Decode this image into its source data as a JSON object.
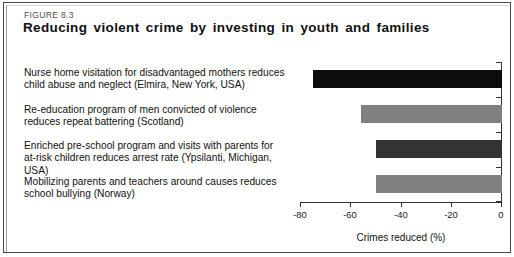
{
  "figure": {
    "number": "FIGURE 8.3",
    "title": "Reducing violent crime by investing in youth and families"
  },
  "chart_data": {
    "type": "bar",
    "orientation": "horizontal",
    "title": "Reducing violent crime by investing in youth and families",
    "xlabel": "Crimes reduced (%)",
    "ylabel": "",
    "xlim": [
      -80,
      0
    ],
    "xticks": [
      -80,
      -60,
      -40,
      -20,
      0
    ],
    "xtick_labels": [
      "-80",
      "-60",
      "-40",
      "-20",
      "0"
    ],
    "grid": false,
    "legend": false,
    "categories": [
      "Nurse home visitation for disadvantaged mothers reduces child abuse and neglect (Elmira, New York, USA)",
      "Re-education program of men convicted of violence reduces repeat battering (Scotland)",
      "Enriched pre-school program and visits with parents for at-risk children reduces arrest rate (Ypsilanti, Michigan, USA)",
      "Mobilizing parents and teachers around causes reduces school bullying (Norway)"
    ],
    "values": [
      -75,
      -56,
      -50,
      -50
    ],
    "bar_colors": [
      "#0d0d0d",
      "#808080",
      "#333333",
      "#808080"
    ]
  },
  "bars": [
    {
      "line1": "Nurse home visitation for disadvantaged mothers reduces",
      "line2": "child abuse and neglect (Elmira, New York, USA)",
      "value": -75,
      "color": "#0d0d0d"
    },
    {
      "line1": "Re-education program of men convicted of violence",
      "line2": "reduces repeat battering (Scotland)",
      "value": -56,
      "color": "#808080"
    },
    {
      "line1": "Enriched pre-school program and visits with parents for",
      "line2": "at-risk children reduces arrest rate (Ypsilanti, Michigan, USA)",
      "value": -50,
      "color": "#333333"
    },
    {
      "line1": "Mobilizing parents and teachers around causes reduces",
      "line2": "school bullying (Norway)",
      "value": -50,
      "color": "#808080"
    }
  ],
  "axis": {
    "label": "Crimes reduced (%)",
    "ticks": [
      "-80",
      "-60",
      "-40",
      "-20",
      "0"
    ]
  }
}
